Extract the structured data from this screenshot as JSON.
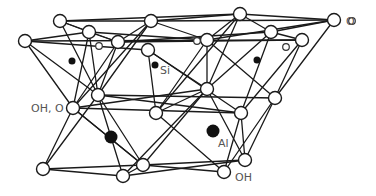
{
  "labels": {
    "oxygen": "O",
    "silicon": "Si",
    "hydroxyl_oxygen": "OH, O",
    "aluminum": "Al",
    "hydroxyl": "OH"
  },
  "colors": {
    "line": "#1a1a1a",
    "atom_fill": "#ffffff",
    "cation_fill": "#111111",
    "label": "#555555"
  },
  "nodes": {
    "oxygen_large": [
      [
        60,
        21
      ],
      [
        151,
        21
      ],
      [
        240,
        14
      ],
      [
        334,
        20
      ],
      [
        25,
        41
      ],
      [
        89,
        32
      ],
      [
        118,
        42
      ],
      [
        148,
        50
      ],
      [
        207,
        40
      ],
      [
        271,
        32
      ],
      [
        302,
        40
      ],
      [
        73,
        108
      ],
      [
        98,
        95
      ],
      [
        156,
        113
      ],
      [
        207,
        89
      ],
      [
        241,
        113
      ],
      [
        275,
        98
      ],
      [
        43,
        169
      ],
      [
        123,
        176
      ],
      [
        143,
        165
      ],
      [
        224,
        172
      ],
      [
        245,
        160
      ]
    ],
    "small_open": [
      [
        99,
        46
      ],
      [
        197,
        41
      ],
      [
        286,
        47
      ],
      [
        352,
        21
      ]
    ],
    "silicon": [
      [
        72,
        61
      ],
      [
        155,
        65
      ],
      [
        257,
        60
      ]
    ],
    "aluminum": [
      [
        111,
        137
      ],
      [
        213,
        131
      ]
    ]
  },
  "bonds": [
    [
      60,
      21,
      151,
      21
    ],
    [
      60,
      21,
      240,
      14
    ],
    [
      151,
      21,
      240,
      14
    ],
    [
      151,
      21,
      334,
      20
    ],
    [
      240,
      14,
      334,
      20
    ],
    [
      207,
      40,
      334,
      20
    ],
    [
      271,
      32,
      334,
      20
    ],
    [
      25,
      41,
      89,
      32
    ],
    [
      25,
      41,
      148,
      50
    ],
    [
      25,
      41,
      302,
      40
    ],
    [
      89,
      32,
      118,
      42
    ],
    [
      89,
      32,
      207,
      40
    ],
    [
      118,
      42,
      271,
      32
    ],
    [
      118,
      42,
      302,
      40
    ],
    [
      60,
      21,
      89,
      32
    ],
    [
      60,
      21,
      118,
      42
    ],
    [
      151,
      21,
      118,
      42
    ],
    [
      151,
      21,
      207,
      40
    ],
    [
      240,
      14,
      207,
      40
    ],
    [
      240,
      14,
      271,
      32
    ],
    [
      271,
      32,
      302,
      40
    ],
    [
      89,
      32,
      73,
      108
    ],
    [
      89,
      32,
      98,
      95
    ],
    [
      118,
      42,
      98,
      95
    ],
    [
      118,
      42,
      73,
      108
    ],
    [
      148,
      50,
      156,
      113
    ],
    [
      148,
      50,
      207,
      89
    ],
    [
      148,
      50,
      241,
      113
    ],
    [
      207,
      40,
      207,
      89
    ],
    [
      207,
      40,
      156,
      113
    ],
    [
      207,
      40,
      275,
      98
    ],
    [
      271,
      32,
      241,
      113
    ],
    [
      271,
      32,
      207,
      89
    ],
    [
      302,
      40,
      275,
      98
    ],
    [
      302,
      40,
      241,
      113
    ],
    [
      334,
      20,
      275,
      98
    ],
    [
      25,
      41,
      73,
      108
    ],
    [
      25,
      41,
      98,
      95
    ],
    [
      60,
      21,
      98,
      95
    ],
    [
      151,
      21,
      73,
      108
    ],
    [
      151,
      21,
      98,
      95
    ],
    [
      240,
      14,
      207,
      89
    ],
    [
      240,
      14,
      156,
      113
    ],
    [
      73,
      108,
      207,
      89
    ],
    [
      73,
      108,
      241,
      113
    ],
    [
      98,
      95,
      241,
      113
    ],
    [
      98,
      95,
      275,
      98
    ],
    [
      156,
      113,
      207,
      89
    ],
    [
      73,
      108,
      43,
      169
    ],
    [
      98,
      95,
      43,
      169
    ],
    [
      73,
      108,
      143,
      165
    ],
    [
      98,
      95,
      123,
      176
    ],
    [
      43,
      169,
      123,
      176
    ],
    [
      43,
      169,
      143,
      165
    ],
    [
      123,
      176,
      143,
      165
    ],
    [
      207,
      89,
      143,
      165
    ],
    [
      207,
      89,
      123,
      176
    ],
    [
      241,
      113,
      245,
      160
    ],
    [
      275,
      98,
      245,
      160
    ],
    [
      275,
      98,
      224,
      172
    ],
    [
      241,
      113,
      224,
      172
    ],
    [
      143,
      165,
      245,
      160
    ],
    [
      143,
      165,
      224,
      172
    ],
    [
      123,
      176,
      245,
      160
    ],
    [
      156,
      113,
      224,
      172
    ],
    [
      207,
      89,
      245,
      160
    ],
    [
      73,
      108,
      143,
      165
    ],
    [
      98,
      95,
      143,
      165
    ]
  ],
  "label_positions": {
    "oxygen": [
      346,
      16
    ],
    "silicon": [
      160,
      65
    ],
    "hydroxyl_oxygen": [
      31,
      103
    ],
    "aluminum": [
      218,
      138
    ],
    "hydroxyl": [
      235,
      172
    ]
  }
}
